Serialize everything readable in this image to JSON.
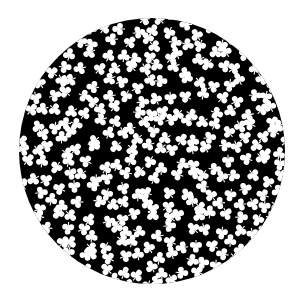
{
  "image": {
    "width": 303,
    "height": 306,
    "background": "#ffffff",
    "subject": "Black circular disc densely filled with white three-leaf clover (trefoil) shapes at random orientations"
  },
  "disc": {
    "cx": 152,
    "cy": 151,
    "r": 133,
    "fill": "#000000"
  },
  "clovers": {
    "fill": "#ffffff",
    "icon": "clover-icon",
    "lobe_radius": 2.9,
    "lobe_offset": 3.3,
    "stem_length": 6.5,
    "stem_width": 1.1,
    "spacing": 15.5,
    "jitter": 5.5,
    "seed": 7
  }
}
